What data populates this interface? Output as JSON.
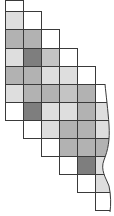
{
  "diagram": {
    "type": "staircase-grid",
    "grid": {
      "origin_x": 5,
      "col_width": 18,
      "row_tops": [
        0,
        11,
        29,
        48,
        66,
        84,
        102,
        120,
        138,
        156,
        174,
        192
      ],
      "row_height": 18
    },
    "shade_palette": {
      "white": "#ffffff",
      "light": "#dedede",
      "medium": "#c4c4c4",
      "gray": "#b2b2b2",
      "dark": "#7e7e7e"
    },
    "cells": [
      {
        "row": 0,
        "col": 0,
        "shade": "white"
      },
      {
        "row": 1,
        "col": 0,
        "shade": "light"
      },
      {
        "row": 1,
        "col": 1,
        "shade": "white"
      },
      {
        "row": 2,
        "col": 0,
        "shade": "gray"
      },
      {
        "row": 2,
        "col": 1,
        "shade": "gray"
      },
      {
        "row": 2,
        "col": 2,
        "shade": "white"
      },
      {
        "row": 3,
        "col": 0,
        "shade": "light"
      },
      {
        "row": 3,
        "col": 1,
        "shade": "dark"
      },
      {
        "row": 3,
        "col": 2,
        "shade": "medium"
      },
      {
        "row": 3,
        "col": 3,
        "shade": "white"
      },
      {
        "row": 4,
        "col": 0,
        "shade": "gray"
      },
      {
        "row": 4,
        "col": 1,
        "shade": "gray"
      },
      {
        "row": 4,
        "col": 2,
        "shade": "light"
      },
      {
        "row": 4,
        "col": 3,
        "shade": "light"
      },
      {
        "row": 4,
        "col": 4,
        "shade": "white"
      },
      {
        "row": 5,
        "col": 0,
        "shade": "light"
      },
      {
        "row": 5,
        "col": 1,
        "shade": "gray"
      },
      {
        "row": 5,
        "col": 2,
        "shade": "gray"
      },
      {
        "row": 5,
        "col": 3,
        "shade": "medium"
      },
      {
        "row": 5,
        "col": 4,
        "shade": "gray"
      },
      {
        "row": 5,
        "col": 5,
        "shade": "white"
      },
      {
        "row": 6,
        "col": 0,
        "shade": "white"
      },
      {
        "row": 6,
        "col": 1,
        "shade": "dark"
      },
      {
        "row": 6,
        "col": 2,
        "shade": "light"
      },
      {
        "row": 6,
        "col": 3,
        "shade": "light"
      },
      {
        "row": 6,
        "col": 4,
        "shade": "gray"
      },
      {
        "row": 6,
        "col": 5,
        "shade": "light"
      },
      {
        "row": 7,
        "col": 1,
        "shade": "white"
      },
      {
        "row": 7,
        "col": 2,
        "shade": "light"
      },
      {
        "row": 7,
        "col": 3,
        "shade": "gray"
      },
      {
        "row": 7,
        "col": 4,
        "shade": "gray"
      },
      {
        "row": 7,
        "col": 5,
        "shade": "light"
      },
      {
        "row": 8,
        "col": 2,
        "shade": "white"
      },
      {
        "row": 8,
        "col": 3,
        "shade": "gray"
      },
      {
        "row": 8,
        "col": 4,
        "shade": "gray"
      },
      {
        "row": 8,
        "col": 5,
        "shade": "gray"
      },
      {
        "row": 9,
        "col": 3,
        "shade": "white"
      },
      {
        "row": 9,
        "col": 4,
        "shade": "dark"
      },
      {
        "row": 9,
        "col": 5,
        "shade": "light"
      },
      {
        "row": 10,
        "col": 4,
        "shade": "white"
      },
      {
        "row": 10,
        "col": 5,
        "shade": "light"
      },
      {
        "row": 11,
        "col": 5,
        "shade": "white"
      }
    ]
  }
}
